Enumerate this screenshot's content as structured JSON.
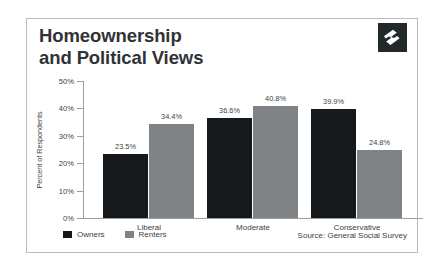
{
  "card": {
    "title": "Homeownership\nand Political Views",
    "logo_icon": "zillow-z-logo-icon"
  },
  "chart_data": {
    "type": "bar",
    "title": "Homeownership and Political Views",
    "xlabel": "",
    "ylabel": "Percent of Respondents",
    "categories": [
      "Liberal",
      "Moderate",
      "Conservative"
    ],
    "series": [
      {
        "name": "Owners",
        "color": "#16191b",
        "values": [
          23.5,
          36.6,
          39.9
        ],
        "labels": [
          "23.5%",
          "36.6%",
          "39.9%"
        ]
      },
      {
        "name": "Renters",
        "color": "#7f8386",
        "values": [
          34.4,
          40.8,
          24.8
        ],
        "labels": [
          "34.4%",
          "40.8%",
          "24.8%"
        ]
      }
    ],
    "ylim": [
      0,
      50
    ],
    "yticks": [
      50,
      40,
      30,
      20,
      10,
      0
    ],
    "ytick_labels": [
      "50%",
      "40%",
      "30%",
      "20%",
      "10%",
      "0%"
    ],
    "grid": false,
    "legend_position": "bottom-left",
    "source": "Source: General Social Survey"
  }
}
